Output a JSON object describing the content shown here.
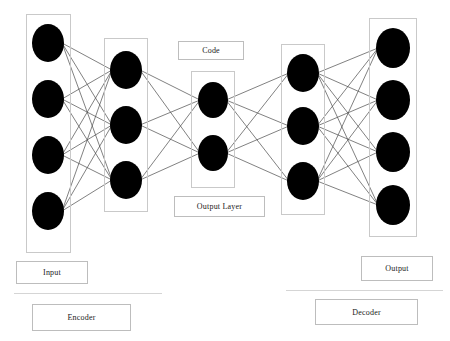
{
  "diagram": {
    "background_color": "#ffffff",
    "node_color": "#000000",
    "box_border_color": "#c9c9c9",
    "edge_color": "#4a4a4a"
  },
  "labels": {
    "code": "Code",
    "output_layer": "Output Layer",
    "input": "Input",
    "output": "Output",
    "encoder": "Encoder",
    "decoder": "Decoder"
  },
  "layers": [
    {
      "id": "input-layer",
      "name": "Input",
      "node_count": 4,
      "box": {
        "x": 26,
        "y": 14,
        "w": 45,
        "h": 239
      },
      "nodes": [
        {
          "cx": 48,
          "cy": 43,
          "rx": 16,
          "ry": 19
        },
        {
          "cx": 48,
          "cy": 99,
          "rx": 16,
          "ry": 19
        },
        {
          "cx": 48,
          "cy": 155,
          "rx": 16,
          "ry": 19
        },
        {
          "cx": 48,
          "cy": 211,
          "rx": 16,
          "ry": 19
        }
      ]
    },
    {
      "id": "encoder-hidden-layer",
      "name": "Encoder hidden layer",
      "node_count": 3,
      "box": {
        "x": 104,
        "y": 38,
        "w": 44,
        "h": 174
      },
      "nodes": [
        {
          "cx": 126,
          "cy": 70,
          "rx": 16,
          "ry": 19
        },
        {
          "cx": 126,
          "cy": 125,
          "rx": 16,
          "ry": 19
        },
        {
          "cx": 126,
          "cy": 180,
          "rx": 16,
          "ry": 19
        }
      ]
    },
    {
      "id": "code-layer",
      "name": "Code",
      "node_count": 2,
      "box": {
        "x": 191,
        "y": 71,
        "w": 44,
        "h": 117
      },
      "nodes": [
        {
          "cx": 213,
          "cy": 100,
          "rx": 15,
          "ry": 18
        },
        {
          "cx": 213,
          "cy": 153,
          "rx": 15,
          "ry": 18
        }
      ]
    },
    {
      "id": "decoder-hidden-layer",
      "name": "Decoder hidden layer",
      "node_count": 3,
      "box": {
        "x": 281,
        "y": 44,
        "w": 44,
        "h": 171
      },
      "nodes": [
        {
          "cx": 303,
          "cy": 73,
          "rx": 16,
          "ry": 19
        },
        {
          "cx": 303,
          "cy": 126,
          "rx": 16,
          "ry": 19
        },
        {
          "cx": 303,
          "cy": 181,
          "rx": 16,
          "ry": 19
        }
      ]
    },
    {
      "id": "output-layer",
      "name": "Output",
      "node_count": 4,
      "box": {
        "x": 369,
        "y": 18,
        "w": 48,
        "h": 219
      },
      "nodes": [
        {
          "cx": 393,
          "cy": 48,
          "rx": 17,
          "ry": 20
        },
        {
          "cx": 393,
          "cy": 100,
          "rx": 17,
          "ry": 20
        },
        {
          "cx": 393,
          "cy": 152,
          "rx": 17,
          "ry": 20
        },
        {
          "cx": 393,
          "cy": 205,
          "rx": 17,
          "ry": 20
        }
      ]
    }
  ],
  "connections": [
    {
      "from_layer": 0,
      "to_layer": 1,
      "fully_connected": true
    },
    {
      "from_layer": 1,
      "to_layer": 2,
      "fully_connected": true
    },
    {
      "from_layer": 2,
      "to_layer": 3,
      "fully_connected": true
    },
    {
      "from_layer": 3,
      "to_layer": 4,
      "fully_connected": true
    }
  ],
  "label_boxes": [
    {
      "id": "code-label",
      "text_key": "code",
      "x": 178,
      "y": 41,
      "w": 66,
      "h": 19,
      "font_size": 8
    },
    {
      "id": "output-layer-label",
      "text_key": "output_layer",
      "x": 174,
      "y": 196,
      "w": 91,
      "h": 21,
      "font_size": 8
    },
    {
      "id": "input-label",
      "text_key": "input",
      "x": 16,
      "y": 261,
      "w": 72,
      "h": 23,
      "font_size": 8
    },
    {
      "id": "output-label",
      "text_key": "output",
      "x": 361,
      "y": 256,
      "w": 72,
      "h": 25,
      "font_size": 8
    },
    {
      "id": "encoder-label",
      "text_key": "encoder",
      "x": 32,
      "y": 304,
      "w": 99,
      "h": 27,
      "font_size": 8
    },
    {
      "id": "decoder-label",
      "text_key": "decoder",
      "x": 315,
      "y": 299,
      "w": 103,
      "h": 26,
      "font_size": 8
    }
  ],
  "divider_rules": [
    {
      "id": "encoder-rule",
      "x": 14,
      "y": 293,
      "w": 148
    },
    {
      "id": "decoder-rule",
      "x": 286,
      "y": 290,
      "w": 157
    }
  ]
}
